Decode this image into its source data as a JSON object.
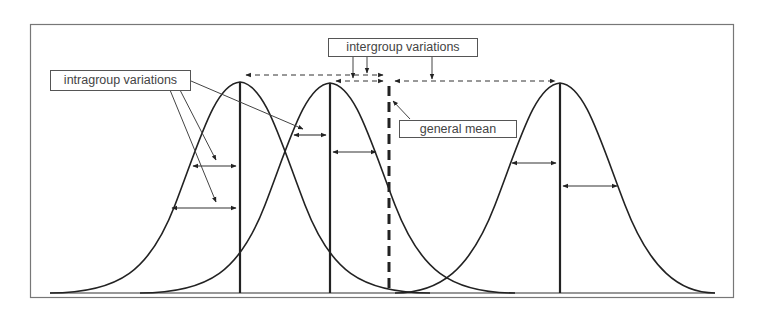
{
  "diagram": {
    "title": "",
    "labels": {
      "intragroup": "intragroup variations",
      "intergroup": "intergroup variations",
      "general_mean": "general mean"
    },
    "groups": [
      {
        "name": "group-1",
        "mean_x": 240,
        "peak_y": 82
      },
      {
        "name": "group-2",
        "mean_x": 330,
        "peak_y": 83
      },
      {
        "name": "group-3",
        "mean_x": 560,
        "peak_y": 83
      }
    ],
    "general_mean_x": 390,
    "colors": {
      "line": "#222222",
      "frame": "#666666",
      "text": "#444444",
      "background": "#ffffff"
    }
  }
}
